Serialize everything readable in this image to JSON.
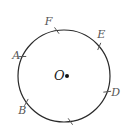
{
  "diagram": {
    "type": "circle-with-arc-marks",
    "circle": {
      "cx": 64,
      "cy": 76,
      "r": 46,
      "stroke": "#2a2a2a",
      "stroke_width": 1.2
    },
    "center": {
      "label": "O",
      "x": 64,
      "y": 76,
      "dot_color": "#111111"
    },
    "points": [
      {
        "label": "F",
        "angle_deg": 99,
        "label_dx": -12,
        "label_dy": -6
      },
      {
        "label": "E",
        "angle_deg": 40,
        "label_dx": -2,
        "label_dy": -8
      },
      {
        "label": "A",
        "angle_deg": 155,
        "label_dx": -10,
        "label_dy": 2
      },
      {
        "label": "D",
        "angle_deg": -20,
        "label_dx": 4,
        "label_dy": 4
      },
      {
        "label": "B",
        "angle_deg": -145,
        "label_dx": -8,
        "label_dy": 12
      },
      {
        "label": "",
        "angle_deg": -82,
        "label_dx": 0,
        "label_dy": 0
      }
    ],
    "label_color": "#555555",
    "tick_color": "#555555"
  }
}
